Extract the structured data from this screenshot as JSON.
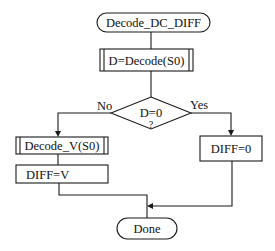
{
  "diagram": {
    "type": "flowchart",
    "nodes": {
      "start": {
        "label": "Decode_DC_DIFF",
        "shape": "terminal"
      },
      "decode": {
        "label": "D=Decode(S0)",
        "shape": "predefined-process"
      },
      "decision": {
        "label_line1": "D=0",
        "label_line2": "?",
        "shape": "decision"
      },
      "decode_v": {
        "label": "Decode_V(S0)",
        "shape": "predefined-process"
      },
      "diff_v": {
        "label": "DIFF=V",
        "shape": "process"
      },
      "diff_zero": {
        "label": "DIFF=0",
        "shape": "process"
      },
      "done": {
        "label": "Done",
        "shape": "terminal"
      }
    },
    "edges": {
      "no_label": "No",
      "yes_label": "Yes"
    },
    "colors": {
      "stroke": "#1a1a1a",
      "background": "#ffffff"
    }
  }
}
